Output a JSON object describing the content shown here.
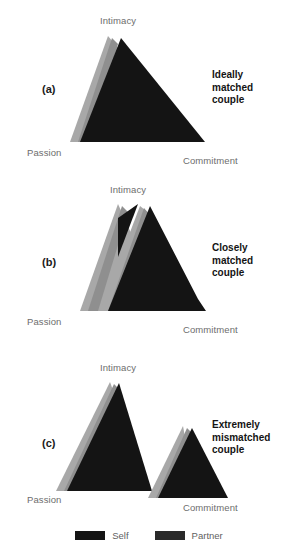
{
  "figure": {
    "colors": {
      "self": "#141414",
      "partner": "#a8a8a8",
      "partner_shade": "#8f8f8f",
      "label_text": "#6d6d6d",
      "caption_text": "#141414",
      "background": "#ffffff"
    }
  },
  "panels": [
    {
      "letter": "(a)",
      "caption_lines": [
        "Ideally",
        "matched",
        "couple"
      ],
      "labels": {
        "intimacy": "Intimacy",
        "passion": "Passion",
        "commitment": "Commitment"
      }
    },
    {
      "letter": "(b)",
      "caption_lines": [
        "Closely",
        "matched",
        "couple"
      ],
      "labels": {
        "intimacy": "Intimacy",
        "passion": "Passion",
        "commitment": "Commitment"
      }
    },
    {
      "letter": "(c)",
      "caption_lines": [
        "Extremely",
        "mismatched",
        "couple"
      ],
      "labels": {
        "intimacy": "Intimacy",
        "passion": "Passion",
        "commitment": "Commitment"
      }
    }
  ],
  "legend": {
    "items": [
      {
        "label": "Self",
        "color": "#141414"
      },
      {
        "label": "Partner",
        "color": "#2a2a2a"
      }
    ]
  }
}
